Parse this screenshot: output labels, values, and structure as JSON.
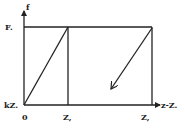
{
  "diagram": {
    "y_axis_label": "f",
    "x_axis_label": "z-Z.",
    "y_ticks": {
      "top": "F.",
      "bottom": "kZ."
    },
    "x_ticks": {
      "origin": "0",
      "z1": "Z,",
      "z2": "Z,"
    },
    "colors": {
      "line": "#222222",
      "background": "#ffffff"
    }
  }
}
